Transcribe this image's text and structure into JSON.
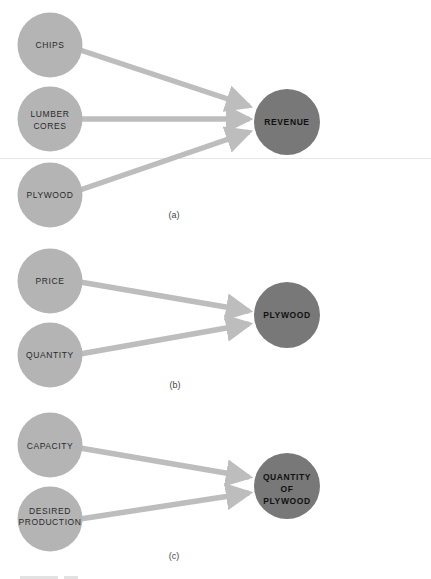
{
  "colors": {
    "input_node": "#b4b4b4",
    "result_node": "#787878",
    "arrow": "#bdbdbd",
    "background": "#ffffff"
  },
  "diagrams": [
    {
      "caption": "(a)",
      "inputs": [
        {
          "lines": [
            "CHIPS"
          ]
        },
        {
          "lines": [
            "LUMBER",
            "CORES"
          ]
        },
        {
          "lines": [
            "PLYWOOD"
          ]
        }
      ],
      "result": {
        "lines": [
          "REVENUE"
        ]
      }
    },
    {
      "caption": "(b)",
      "inputs": [
        {
          "lines": [
            "PRICE"
          ]
        },
        {
          "lines": [
            "QUANTITY"
          ]
        }
      ],
      "result": {
        "lines": [
          "PLYWOOD"
        ]
      }
    },
    {
      "caption": "(c)",
      "inputs": [
        {
          "lines": [
            "CAPACITY"
          ]
        },
        {
          "lines": [
            "DESIRED",
            "PRODUCTION"
          ]
        }
      ],
      "result": {
        "lines": [
          "QUANTITY",
          "OF",
          "PLYWOOD"
        ]
      }
    }
  ]
}
